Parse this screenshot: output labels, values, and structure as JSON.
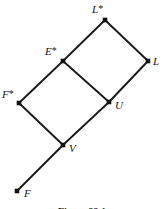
{
  "figure": {
    "caption": "Figure 22.1",
    "caption_clipped": true,
    "background_color": "#ffffff",
    "line_color": "#1a1a1a",
    "node_color": "#111111",
    "label_color": "#151515"
  },
  "chart_data": {
    "type": "diagram",
    "subtype": "lattice-hasse-diagram",
    "title": "Figure 22.1",
    "xlabel": "",
    "ylabel": "",
    "grid": false,
    "legend": "none",
    "xlim": [
      0,
      164
    ],
    "ylim": [
      0,
      209
    ],
    "nodes": [
      {
        "id": "Lstar",
        "label": "L",
        "star": true,
        "x": 105,
        "y": 20,
        "label_x": 92,
        "label_y": 3,
        "marker": "square"
      },
      {
        "id": "L",
        "label": "L",
        "star": false,
        "x": 148,
        "y": 61,
        "label_x": 153,
        "label_y": 56,
        "marker": "square"
      },
      {
        "id": "Estar",
        "label": "E",
        "star": true,
        "x": 63,
        "y": 61,
        "label_x": 45,
        "label_y": 45,
        "marker": "square"
      },
      {
        "id": "Fstar",
        "label": "F",
        "star": true,
        "x": 19,
        "y": 103,
        "label_x": 2,
        "label_y": 88,
        "marker": "square"
      },
      {
        "id": "U",
        "label": "U",
        "star": false,
        "x": 109,
        "y": 102,
        "label_x": 115,
        "label_y": 100,
        "marker": "square"
      },
      {
        "id": "V",
        "label": "V",
        "star": false,
        "x": 63,
        "y": 145,
        "label_x": 69,
        "label_y": 143,
        "marker": "square"
      },
      {
        "id": "F",
        "label": "F",
        "star": false,
        "x": 17,
        "y": 191,
        "label_x": 24,
        "label_y": 188,
        "marker": "square"
      }
    ],
    "edges": [
      {
        "from": "Estar",
        "to": "Lstar"
      },
      {
        "from": "Lstar",
        "to": "L"
      },
      {
        "from": "Estar",
        "to": "U"
      },
      {
        "from": "U",
        "to": "L"
      },
      {
        "from": "Fstar",
        "to": "Estar"
      },
      {
        "from": "Fstar",
        "to": "V"
      },
      {
        "from": "V",
        "to": "U"
      },
      {
        "from": "V",
        "to": "F"
      }
    ]
  }
}
